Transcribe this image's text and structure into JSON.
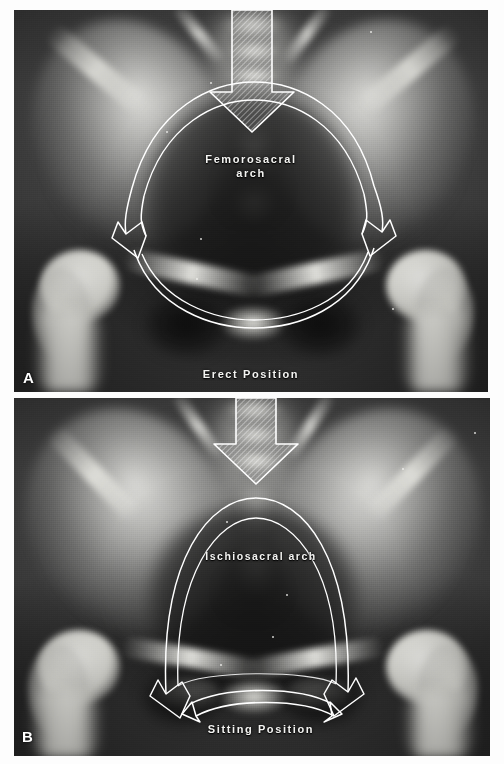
{
  "figure": {
    "type": "radiograph-figure",
    "background_color": "#ffffff"
  },
  "panels": [
    {
      "letter": "A",
      "position_label": "Erect Position",
      "arch_label": "Femorosacral\narch",
      "arch_label_line1": "Femorosacral",
      "arch_label_line2": "arch",
      "load_arrow": "downward-hatched-arrow",
      "force_arrows": [
        "left-curved-arrow-to-acetabulum",
        "right-curved-arrow-to-acetabulum"
      ],
      "arc_lines": 2,
      "inferior_arc_lines": 2
    },
    {
      "letter": "B",
      "position_label": "Sitting Position",
      "arch_label": "Ischiosacral arch",
      "load_arrow": "downward-hatched-arrow",
      "force_arrows": [
        "left-curved-arrow-to-ischium",
        "right-curved-arrow-to-ischium",
        "bottom-double-headed-arc"
      ],
      "arc_lines": 2,
      "inferior_arc_lines": 1
    }
  ],
  "overlay": {
    "stroke_color": "#ffffff",
    "arrow_fill": "hatched-translucent",
    "label_color": "#f4f4f2"
  }
}
